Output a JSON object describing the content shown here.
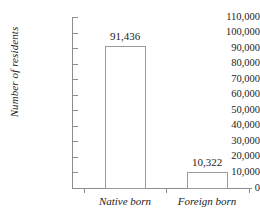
{
  "chart_data": {
    "type": "bar",
    "title": "",
    "xlabel": "",
    "ylabel": "Number of residents",
    "categories": [
      "Native born",
      "Foreign born"
    ],
    "values": [
      91436,
      10322
    ],
    "value_labels": [
      "91,436",
      "10,322"
    ],
    "ylim": [
      0,
      110000
    ],
    "ytick_step": 10000,
    "ytick_labels": [
      "110,000",
      "100,000",
      "90,000",
      "80,000",
      "70,000",
      "60,000",
      "50,000",
      "40,000",
      "30,000",
      "20,000",
      "10,000",
      "0"
    ],
    "ytick_values": [
      110000,
      100000,
      90000,
      80000,
      70000,
      60000,
      50000,
      40000,
      30000,
      20000,
      10000,
      0
    ],
    "grid": false,
    "legend": false,
    "bar_fill": "#ffffff",
    "bar_border": "#9a9a9a",
    "axis_color": "#8d8d8d",
    "text_color": "#1c1c1c"
  }
}
